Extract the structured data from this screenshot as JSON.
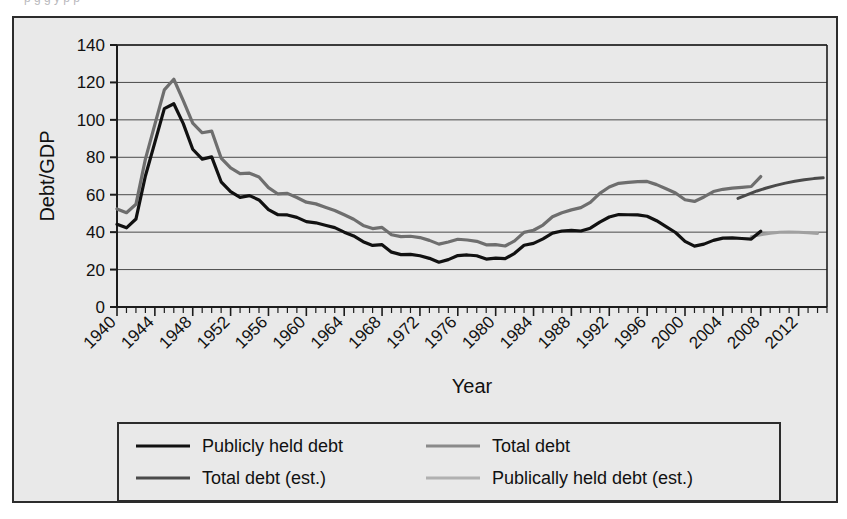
{
  "caption_sliver": "p         g      g y   p    p",
  "chart_data": {
    "type": "line",
    "title": "",
    "xlabel": "Year",
    "ylabel": "Debt/GDP",
    "xlim": [
      1940,
      2015
    ],
    "ylim": [
      0,
      140
    ],
    "ytick_values": [
      0,
      20,
      40,
      60,
      80,
      100,
      120,
      140
    ],
    "ytick_labels": [
      "0",
      "20",
      "40",
      "60",
      "80",
      "100",
      "120",
      "140"
    ],
    "xtick_labels": [
      "1940",
      "1944",
      "1948",
      "1952",
      "1956",
      "1960",
      "1964",
      "1968",
      "1972",
      "1976",
      "1980",
      "1984",
      "1988",
      "1992",
      "1996",
      "2000",
      "2004",
      "2008",
      "2012"
    ],
    "xtick_values": [
      1940,
      1944,
      1948,
      1952,
      1956,
      1960,
      1964,
      1968,
      1972,
      1976,
      1980,
      1984,
      1988,
      1992,
      1996,
      2000,
      2004,
      2008,
      2012
    ],
    "minor_xtick_step": 1,
    "grid": "horizontal",
    "legend_position": "below-plot",
    "series": [
      {
        "name": "Publicly held debt",
        "color": "#111111",
        "width": 3.2,
        "x": [
          1940,
          1941,
          1942,
          1943,
          1944,
          1945,
          1946,
          1947,
          1948,
          1949,
          1950,
          1951,
          1952,
          1953,
          1954,
          1955,
          1956,
          1957,
          1958,
          1959,
          1960,
          1961,
          1962,
          1963,
          1964,
          1965,
          1966,
          1967,
          1968,
          1969,
          1970,
          1971,
          1972,
          1973,
          1974,
          1975,
          1976,
          1977,
          1978,
          1979,
          1980,
          1981,
          1982,
          1983,
          1984,
          1985,
          1986,
          1987,
          1988,
          1989,
          1990,
          1991,
          1992,
          1993,
          1994,
          1995,
          1996,
          1997,
          1998,
          1999,
          2000,
          2001,
          2002,
          2003,
          2004,
          2005,
          2006,
          2007,
          2008
        ],
        "values": [
          44.2,
          42.3,
          47.0,
          70.0,
          88.0,
          106.0,
          108.6,
          98.0,
          84.3,
          79.0,
          80.2,
          66.9,
          61.6,
          58.6,
          59.5,
          57.2,
          52.0,
          49.3,
          49.2,
          47.9,
          45.6,
          45.0,
          43.7,
          42.4,
          40.0,
          38.0,
          34.9,
          32.9,
          33.3,
          29.3,
          28.0,
          28.1,
          27.4,
          26.0,
          23.9,
          25.3,
          27.5,
          27.8,
          27.4,
          25.6,
          26.1,
          25.8,
          28.7,
          33.0,
          34.0,
          36.4,
          39.5,
          40.6,
          40.9,
          40.6,
          42.1,
          45.4,
          48.1,
          49.4,
          49.3,
          49.2,
          48.5,
          46.1,
          43.0,
          39.8,
          35.1,
          32.5,
          33.6,
          35.6,
          36.8,
          36.9,
          36.6,
          36.3,
          40.5
        ]
      },
      {
        "name": "Total debt",
        "color": "#6e6e6e",
        "width": 3.2,
        "x": [
          1940,
          1941,
          1942,
          1943,
          1944,
          1945,
          1946,
          1947,
          1948,
          1949,
          1950,
          1951,
          1952,
          1953,
          1954,
          1955,
          1956,
          1957,
          1958,
          1959,
          1960,
          1961,
          1962,
          1963,
          1964,
          1965,
          1966,
          1967,
          1968,
          1969,
          1970,
          1971,
          1972,
          1973,
          1974,
          1975,
          1976,
          1977,
          1978,
          1979,
          1980,
          1981,
          1982,
          1983,
          1984,
          1985,
          1986,
          1987,
          1988,
          1989,
          1990,
          1991,
          1992,
          1993,
          1994,
          1995,
          1996,
          1997,
          1998,
          1999,
          2000,
          2001,
          2002,
          2003,
          2004,
          2005,
          2006,
          2007,
          2008
        ],
        "values": [
          52.4,
          50.4,
          54.9,
          79.0,
          97.6,
          116.0,
          121.7,
          110.3,
          98.2,
          93.1,
          94.0,
          79.6,
          74.3,
          71.3,
          71.5,
          69.5,
          63.8,
          60.4,
          60.7,
          58.5,
          56.0,
          55.1,
          53.3,
          51.6,
          49.3,
          46.9,
          43.6,
          41.9,
          42.5,
          38.6,
          37.6,
          37.8,
          37.1,
          35.6,
          33.6,
          34.7,
          36.2,
          35.8,
          35.1,
          33.2,
          33.3,
          32.6,
          35.3,
          39.9,
          41.0,
          43.8,
          48.2,
          50.4,
          51.9,
          53.1,
          55.9,
          60.7,
          64.1,
          66.1,
          66.6,
          67.0,
          67.1,
          65.4,
          63.2,
          60.9,
          57.3,
          56.4,
          58.8,
          61.7,
          62.9,
          63.5,
          63.9,
          64.4,
          69.7
        ]
      },
      {
        "name": "Total debt (est.)",
        "color": "#4a4a4a",
        "width": 3.0,
        "x": [
          2008,
          2009,
          2010,
          2011,
          2012,
          2013,
          2014,
          2015
        ],
        "values": [
          69.7,
          72.0,
          74.0,
          75.5,
          76.5,
          77.2,
          77.7,
          78.0
        ]
      },
      {
        "name": "Publically held debt (est.)",
        "color": "#a0a0a0",
        "width": 3.0,
        "x": [
          2008,
          2009,
          2010,
          2011,
          2012,
          2013,
          2014,
          2015
        ],
        "values": [
          40.5,
          40.9,
          41.0,
          40.8,
          40.4,
          39.9,
          39.4,
          39.0
        ]
      }
    ],
    "estimate_branch": {
      "total_est_visual": {
        "x": [
          2005.6,
          2006.6,
          2007.6,
          2008.6,
          2009.6,
          2010.6,
          2011.6,
          2012.6,
          2013.6,
          2014.6
        ],
        "values": [
          58.0,
          60.0,
          62.0,
          63.6,
          65.0,
          66.2,
          67.2,
          68.0,
          68.6,
          69.0
        ]
      },
      "public_est_visual": {
        "x": [
          2007.0,
          2008.0,
          2009.0,
          2010.0,
          2011.0,
          2012.0,
          2013.0,
          2014.0
        ],
        "values": [
          37.6,
          38.6,
          39.4,
          39.9,
          40.1,
          40.0,
          39.7,
          39.3
        ]
      }
    }
  },
  "legend": {
    "items": [
      {
        "label": "Publicly held debt",
        "color": "#111111"
      },
      {
        "label": "Total debt",
        "color": "#8a8a8a"
      },
      {
        "label": "Total debt (est.)",
        "color": "#4a4a4a"
      },
      {
        "label": "Publically held debt (est.)",
        "color": "#b0b0b0"
      }
    ]
  }
}
